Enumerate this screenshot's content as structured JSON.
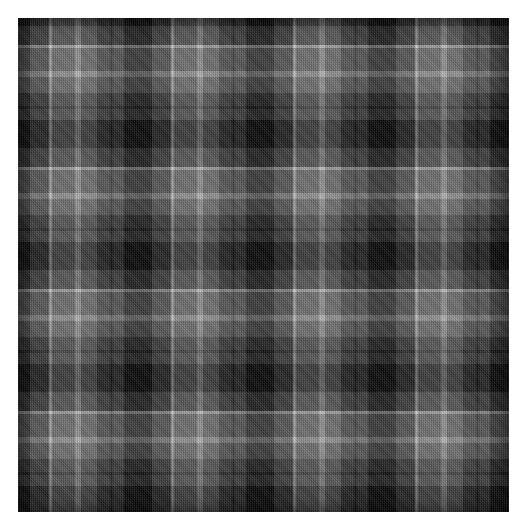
{
  "document": {
    "title": "Tartan fabric swatch",
    "kind": "textile-pattern-image",
    "background_color": "#ffffff"
  },
  "image": {
    "name": "grey-black-tartan-swatch",
    "x": 18,
    "y": 18,
    "width": 491,
    "height": 494
  },
  "palette": {
    "black": "#050505",
    "dark_grey": "#3a3a3a",
    "mid_grey": "#6e6e6e",
    "light_grey": "#b2b2b2",
    "white_line": "#c9c9c9",
    "shadow_line": "#1a1a1a"
  },
  "chart_data": {
    "type": "heatmap",
    "xlabel": "warp threads (px)",
    "ylabel": "weft threads (px)",
    "sett_period_px": 122,
    "repeats_x": 4.02,
    "repeats_y": 4.05,
    "legend": [
      {
        "name": "black",
        "color": "#050505"
      },
      {
        "name": "dark grey",
        "color": "#3a3a3a"
      },
      {
        "name": "mid grey",
        "color": "#6e6e6e"
      },
      {
        "name": "light grey",
        "color": "#b2b2b2"
      },
      {
        "name": "white guard line",
        "color": "#c9c9c9"
      },
      {
        "name": "shadow guard line",
        "color": "#1a1a1a"
      }
    ],
    "warp_bands": [
      {
        "start": 0,
        "width": 28,
        "color": "#050505",
        "name": "black"
      },
      {
        "start": 28,
        "width": 19,
        "color": "#3a3a3a",
        "name": "dark grey"
      },
      {
        "start": 47,
        "width": 3,
        "color": "#c9c9c9",
        "name": "white guard line"
      },
      {
        "start": 50,
        "width": 23,
        "color": "#6e6e6e",
        "name": "mid grey"
      },
      {
        "start": 73,
        "width": 6,
        "color": "#b2b2b2",
        "name": "light grey"
      },
      {
        "start": 79,
        "width": 16,
        "color": "#6e6e6e",
        "name": "mid grey"
      },
      {
        "start": 95,
        "width": 13,
        "color": "#3a3a3a",
        "name": "dark grey"
      },
      {
        "start": 108,
        "width": 3,
        "color": "#1a1a1a",
        "name": "shadow guard line"
      },
      {
        "start": 111,
        "width": 11,
        "color": "#3a3a3a",
        "name": "dark grey"
      }
    ],
    "weft_bands": [
      {
        "start": 0,
        "width": 28,
        "color": "#050505",
        "name": "black"
      },
      {
        "start": 28,
        "width": 19,
        "color": "#3a3a3a",
        "name": "dark grey"
      },
      {
        "start": 47,
        "width": 3,
        "color": "#c9c9c9",
        "name": "white guard line"
      },
      {
        "start": 50,
        "width": 23,
        "color": "#6e6e6e",
        "name": "mid grey"
      },
      {
        "start": 73,
        "width": 6,
        "color": "#b2b2b2",
        "name": "light grey"
      },
      {
        "start": 79,
        "width": 16,
        "color": "#6e6e6e",
        "name": "mid grey"
      },
      {
        "start": 95,
        "width": 13,
        "color": "#3a3a3a",
        "name": "dark grey"
      },
      {
        "start": 108,
        "width": 3,
        "color": "#1a1a1a",
        "name": "shadow guard line"
      },
      {
        "start": 111,
        "width": 11,
        "color": "#3a3a3a",
        "name": "dark grey"
      }
    ],
    "origin_offset_x": -16,
    "origin_offset_y": -20,
    "weave": "2/2 twill",
    "grid": false,
    "legend_position": "none"
  }
}
